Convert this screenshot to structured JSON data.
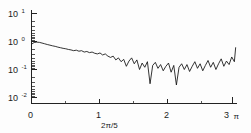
{
  "figure": {
    "background_color": "#fdfdfd",
    "curve_color": "#111111",
    "axis_color": "#232323"
  },
  "labels": {
    "y_10_1_mantissa": "10",
    "y_10_1_exponent": "1",
    "y_10_0_mantissa": "10",
    "y_10_0_exponent": "0",
    "y_10_m1_mantissa": "10",
    "y_10_m1_exponent": "-1",
    "y_10_m2_mantissa": "10",
    "y_10_m2_exponent": "-2",
    "x_0": "0",
    "x_1": "1",
    "x_2": "2",
    "x_3": "3",
    "x_pi_unit": "π",
    "x_annotation": "2π/5"
  },
  "chart_data": {
    "type": "line",
    "title": "",
    "subtitle": "",
    "xlabel": "",
    "ylabel": "",
    "yscale": "log",
    "xscale": "linear",
    "grid": false,
    "legend": null,
    "xlim": [
      0,
      3.12
    ],
    "ylim": [
      0.01,
      10
    ],
    "x_tick_labels": [
      "0",
      "1",
      "2",
      "3"
    ],
    "x_tick_values": [
      0,
      1,
      2,
      3
    ],
    "x_minor_tick_values": [
      0.5,
      1.5,
      2.5
    ],
    "x_axis_unit_label": "π",
    "y_tick_labels": [
      "10^1",
      "10^0",
      "10^-1",
      "10^-2"
    ],
    "y_tick_values": [
      10,
      1,
      0.1,
      0.01
    ],
    "annotations": [
      {
        "text": "2π/5",
        "x": 1.18,
        "y_position": "below-axis"
      }
    ],
    "series": [
      {
        "name": "spectrum",
        "x": [
          0.0,
          0.04,
          0.08,
          0.12,
          0.16,
          0.2,
          0.24,
          0.28,
          0.32,
          0.36,
          0.4,
          0.44,
          0.48,
          0.52,
          0.56,
          0.6,
          0.64,
          0.68,
          0.72,
          0.76,
          0.8,
          0.84,
          0.88,
          0.92,
          0.96,
          1.0,
          1.04,
          1.08,
          1.12,
          1.16,
          1.2,
          1.24,
          1.28,
          1.32,
          1.36,
          1.4,
          1.44,
          1.48,
          1.52,
          1.56,
          1.6,
          1.64,
          1.68,
          1.72,
          1.76,
          1.8,
          1.84,
          1.88,
          1.92,
          1.96,
          2.0,
          2.04,
          2.08,
          2.12,
          2.16,
          2.2,
          2.24,
          2.28,
          2.32,
          2.36,
          2.4,
          2.44,
          2.48,
          2.52,
          2.56,
          2.6,
          2.64,
          2.68,
          2.72,
          2.76,
          2.8,
          2.84,
          2.88,
          2.92,
          2.96,
          3.0,
          3.04,
          3.08,
          3.1
        ],
        "y": [
          0.8,
          0.92,
          0.95,
          0.93,
          0.88,
          0.83,
          0.78,
          0.74,
          0.7,
          0.67,
          0.63,
          0.6,
          0.57,
          0.55,
          0.52,
          0.5,
          0.47,
          0.49,
          0.45,
          0.47,
          0.42,
          0.44,
          0.4,
          0.42,
          0.38,
          0.36,
          0.39,
          0.33,
          0.36,
          0.3,
          0.27,
          0.3,
          0.22,
          0.26,
          0.19,
          0.23,
          0.13,
          0.2,
          0.26,
          0.16,
          0.22,
          0.1,
          0.17,
          0.12,
          0.19,
          0.031,
          0.14,
          0.18,
          0.11,
          0.15,
          0.09,
          0.13,
          0.17,
          0.08,
          0.14,
          0.028,
          0.12,
          0.16,
          0.1,
          0.15,
          0.085,
          0.13,
          0.19,
          0.11,
          0.16,
          0.09,
          0.14,
          0.21,
          0.12,
          0.18,
          0.1,
          0.16,
          0.24,
          0.13,
          0.2,
          0.15,
          0.28,
          0.19,
          0.62
        ]
      }
    ]
  }
}
